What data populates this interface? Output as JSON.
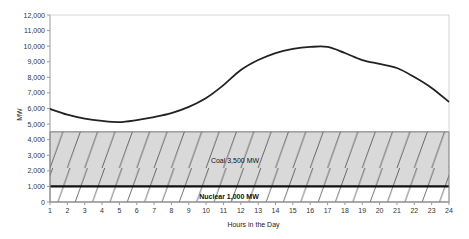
{
  "chart_data": {
    "type": "line",
    "title": "",
    "xlabel": "Hours in the Day",
    "ylabel": "MW",
    "ylim": [
      0,
      12000
    ],
    "yticks": [
      0,
      1000,
      2000,
      3000,
      4000,
      5000,
      6000,
      7000,
      8000,
      9000,
      10000,
      11000,
      12000
    ],
    "ytick_labels": [
      "0",
      "1,000",
      "2,000",
      "3,000",
      "4,000",
      "5,000",
      "6,000",
      "7,000",
      "8,000",
      "9,000",
      "10,000",
      "11,000",
      "12,000"
    ],
    "categories": [
      "1",
      "2",
      "3",
      "4",
      "5",
      "6",
      "7",
      "8",
      "9",
      "10",
      "11",
      "12",
      "13",
      "14",
      "15",
      "16",
      "17",
      "18",
      "19",
      "20",
      "21",
      "22",
      "23",
      "24"
    ],
    "grid": false,
    "legend": "none",
    "series": [
      {
        "name": "Load",
        "color": "#222222",
        "values": [
          5970,
          5600,
          5350,
          5200,
          5130,
          5260,
          5450,
          5700,
          6100,
          6670,
          7500,
          8470,
          9110,
          9560,
          9820,
          9950,
          9950,
          9560,
          9110,
          8860,
          8600,
          8020,
          7320,
          6420
        ]
      }
    ],
    "bands": [
      {
        "name": "Nuclear",
        "label": "Nuclear 1,000 MW",
        "from": 0,
        "to": 1000,
        "fill": "#ffffff",
        "hatch": true
      },
      {
        "name": "Coal",
        "label": "Coal 3,500 MW",
        "from": 1000,
        "to": 4500,
        "fill": "#d9d9d9",
        "hatch": true
      }
    ],
    "colors": {
      "axis": "#999999",
      "line": "#222222",
      "hatch": "#333333",
      "nuclear_line": "#111111"
    }
  }
}
